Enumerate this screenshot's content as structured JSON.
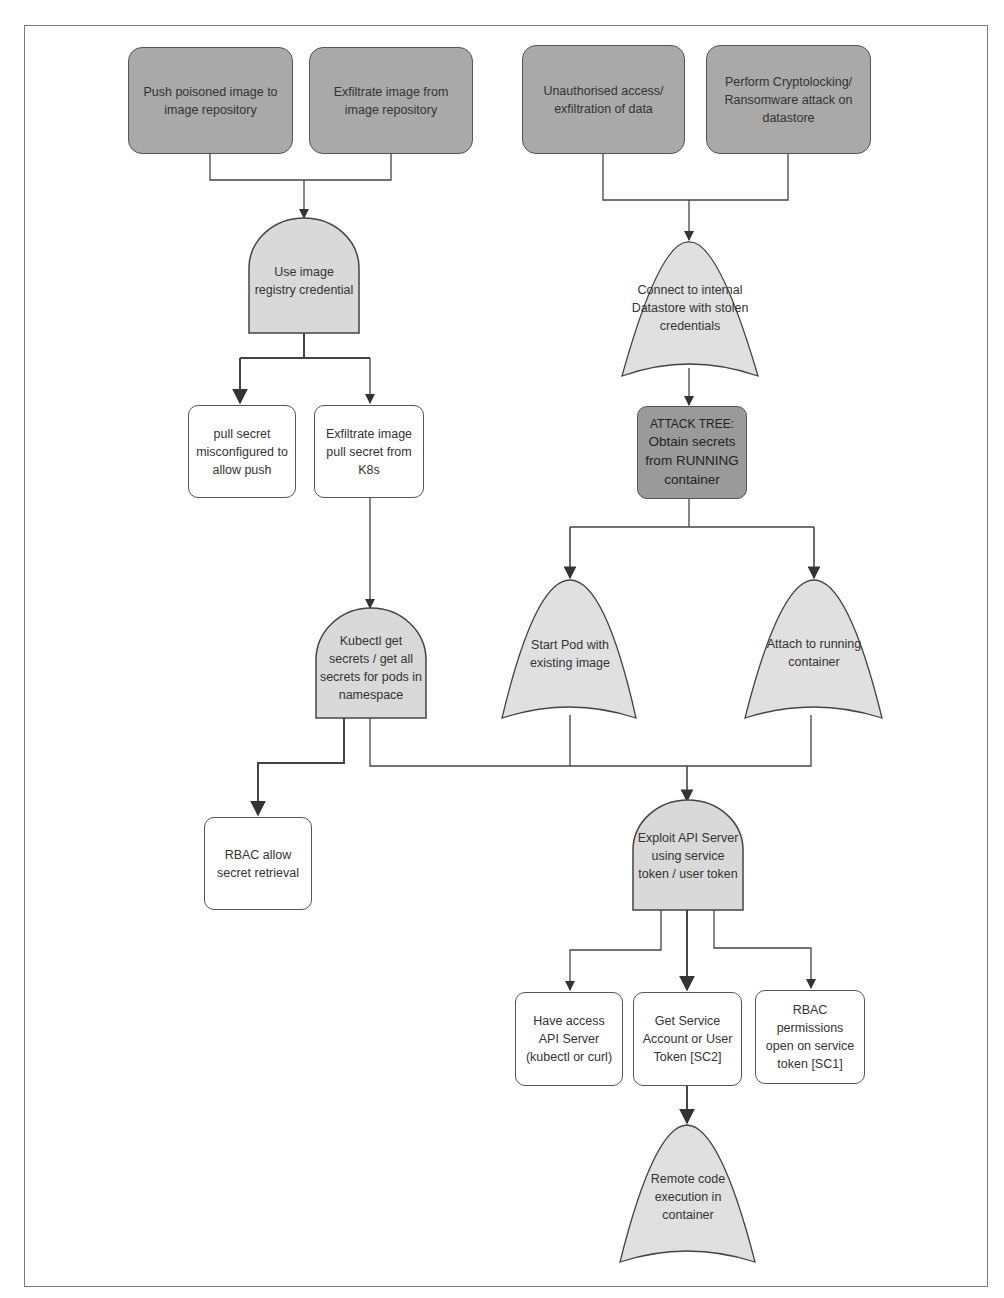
{
  "diagram": {
    "type": "attack-tree",
    "colors": {
      "goal_fill": "#a9a9a9",
      "gate_fill": "#d9d9d9",
      "leaf_fill": "#ffffff",
      "attack_tree_fill": "#9a9a9a",
      "line": "#444444",
      "frame": "#7a7a7a"
    },
    "goals": [
      {
        "id": "push",
        "label": "Push poisoned image to image repository"
      },
      {
        "id": "exfil_img",
        "label": "Exfiltrate image from image repository"
      },
      {
        "id": "unauth",
        "label": "Unauthorised access/ exfiltration of data"
      },
      {
        "id": "crypto",
        "label": "Perform Cryptolocking/ Ransomware attack on datastore"
      }
    ],
    "gates": [
      {
        "id": "use_cred",
        "kind": "and",
        "label": "Use image registry credential"
      },
      {
        "id": "connect_ds",
        "kind": "or",
        "label": "Connect to internal Datastore with stolen credentials"
      },
      {
        "id": "kubectl",
        "kind": "and",
        "label": "Kubectl get secrets / get all secrets for pods in namespace"
      },
      {
        "id": "start_pod",
        "kind": "or",
        "label": "Start Pod with existing image"
      },
      {
        "id": "attach",
        "kind": "or",
        "label": "Attach to running container"
      },
      {
        "id": "exploit_api",
        "kind": "and",
        "label": "Exploit API Server using service token / user token"
      },
      {
        "id": "rce",
        "kind": "or",
        "label": "Remote code execution in container"
      }
    ],
    "attack_tree_ref": {
      "id": "attack_tree",
      "label_head": "ATTACK TREE:",
      "label_body": "Obtain secrets from RUNNING container"
    },
    "leaves": [
      {
        "id": "pull_secret",
        "label": "pull secret misconfigured to allow push"
      },
      {
        "id": "exfil_pull",
        "label": "Exfiltrate image pull secret from K8s"
      },
      {
        "id": "rbac_allow",
        "label": "RBAC allow secret retrieval"
      },
      {
        "id": "have_access",
        "label": "Have access API Server (kubectl or curl)"
      },
      {
        "id": "get_sa",
        "label": "Get Service Account or User Token [SC2]"
      },
      {
        "id": "rbac_perm",
        "label": "RBAC permissions open on service token [SC1]"
      }
    ],
    "edges": [
      {
        "from": "push",
        "to": "use_cred"
      },
      {
        "from": "exfil_img",
        "to": "use_cred"
      },
      {
        "from": "use_cred",
        "to": "pull_secret"
      },
      {
        "from": "use_cred",
        "to": "exfil_pull"
      },
      {
        "from": "exfil_pull",
        "to": "kubectl"
      },
      {
        "from": "kubectl",
        "to": "rbac_allow"
      },
      {
        "from": "kubectl",
        "to": "exploit_api"
      },
      {
        "from": "unauth",
        "to": "connect_ds"
      },
      {
        "from": "crypto",
        "to": "connect_ds"
      },
      {
        "from": "connect_ds",
        "to": "attack_tree"
      },
      {
        "from": "attack_tree",
        "to": "start_pod"
      },
      {
        "from": "attack_tree",
        "to": "attach"
      },
      {
        "from": "start_pod",
        "to": "exploit_api"
      },
      {
        "from": "attach",
        "to": "exploit_api"
      },
      {
        "from": "exploit_api",
        "to": "have_access"
      },
      {
        "from": "exploit_api",
        "to": "get_sa"
      },
      {
        "from": "exploit_api",
        "to": "rbac_perm"
      },
      {
        "from": "get_sa",
        "to": "rce"
      }
    ]
  }
}
